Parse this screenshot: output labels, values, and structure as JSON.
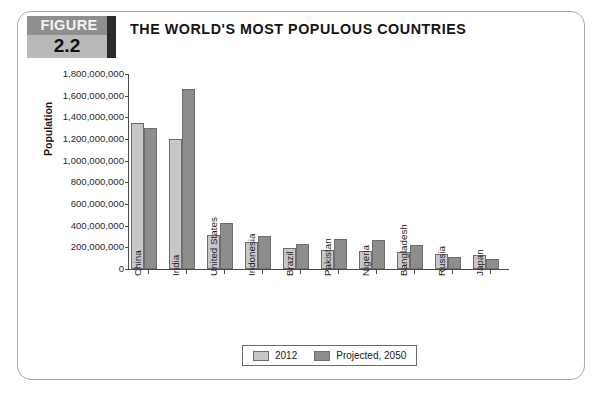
{
  "figure": {
    "label": "FIGURE",
    "number": "2.2"
  },
  "chart_data": {
    "type": "bar",
    "title": "THE WORLD'S MOST POPULOUS COUNTRIES",
    "xlabel": "",
    "ylabel": "Population",
    "ylim": [
      0,
      1800000000
    ],
    "ytick_step": 200000000,
    "grid": false,
    "legend_position": "bottom",
    "ytick_labels": [
      "1,800,000,000",
      "1,600,000,000",
      "1,400,000,000",
      "1,200,000,000",
      "1,000,000,000",
      "800,000,000",
      "600,000,000",
      "400,000,000",
      "200,000,000",
      "0"
    ],
    "categories": [
      "China",
      "India",
      "United States",
      "Indonesia",
      "Brazil",
      "Pakistan",
      "Nigeria",
      "Bangladesh",
      "Russia",
      "Japan"
    ],
    "series": [
      {
        "name": "2012",
        "color": "#c7c7c7",
        "values": [
          1350000000,
          1200000000,
          314000000,
          248000000,
          194000000,
          180000000,
          170000000,
          153000000,
          143000000,
          127000000
        ]
      },
      {
        "name": "Projected, 2050",
        "color": "#8d8d8d",
        "values": [
          1300000000,
          1660000000,
          423000000,
          309000000,
          231000000,
          275000000,
          264000000,
          226000000,
          109000000,
          95000000
        ]
      }
    ]
  }
}
